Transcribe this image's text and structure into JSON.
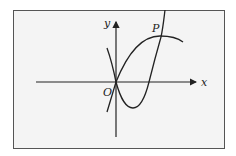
{
  "diagram": {
    "axes": {
      "x_label": "x",
      "y_label": "y",
      "origin_label": "O"
    },
    "points": [
      {
        "label": "P",
        "description": "intersection of the two curves in the first quadrant"
      },
      {
        "label": "O",
        "description": "origin"
      }
    ],
    "curves": [
      {
        "name": "upward-parabola",
        "description": "opens upward, passes through O, minimum in fourth quadrant, rises steeply through P"
      },
      {
        "name": "downward-parabola",
        "description": "opens downward, passes through O, vertex near P"
      }
    ],
    "colors": {
      "background": "#f4f4f4",
      "stroke": "#222222",
      "border": "#555555"
    }
  }
}
